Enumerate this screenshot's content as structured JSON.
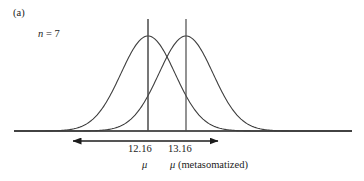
{
  "figure": {
    "panel_label": "(a)",
    "sample_size_symbol": "n",
    "sample_size_equals": " = 7",
    "axis_color": "#1c1c1c",
    "curve_color": "#3d3d3d",
    "marker_line_color": "#4a4a4a",
    "arrow_color": "#1c1c1c"
  },
  "labels": {
    "value_left": "12.16",
    "value_right": "13.16",
    "mu_left": "μ",
    "mu_right_symbol": "μ",
    "mu_right_qualifier": " (metasomatized)"
  },
  "chart_data": {
    "type": "line",
    "title": "",
    "subtitle": "",
    "xlabel": "",
    "ylabel": "",
    "grid": false,
    "legend": "none",
    "annotations": [
      {
        "name": "panel-label",
        "text": "(a)",
        "x_px": 13,
        "y_px": 8
      },
      {
        "name": "sample-size",
        "text": "n = 7",
        "x_px": 38,
        "y_px": 29
      },
      {
        "name": "value-label-left",
        "text": "12.16",
        "x_px": 128,
        "y_px": 144
      },
      {
        "name": "value-label-right",
        "text": "13.16",
        "x_px": 168,
        "y_px": 144
      },
      {
        "name": "mu-label-left",
        "text": "μ",
        "x_px": 142,
        "y_px": 160
      },
      {
        "name": "mu-label-right",
        "text": "μ (metasomatized)",
        "x_px": 170,
        "y_px": 160
      }
    ],
    "axis_baseline": {
      "x_start_px": 14,
      "x_end_px": 352,
      "y_px": 131
    },
    "series": [
      {
        "name": "distribution-unaltered",
        "mean_label": "12.16",
        "mean_x_px": 148,
        "peak_y_px": 36,
        "sigma_px": 27,
        "marker_line": {
          "x_px": 148,
          "y_top_px": 19,
          "y_bottom_px": 131
        }
      },
      {
        "name": "distribution-metasomatized",
        "mean_label": "13.16",
        "mean_x_px": 186,
        "peak_y_px": 36,
        "sigma_px": 27,
        "marker_line": {
          "x_px": 186,
          "y_top_px": 19,
          "y_bottom_px": 131
        }
      }
    ],
    "difference_arrow": {
      "name": "mean-difference-arrow",
      "x_start_px": 73,
      "x_end_px": 218,
      "y_px": 141,
      "double_headed": true
    }
  }
}
